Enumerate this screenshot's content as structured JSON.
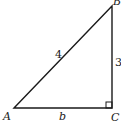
{
  "diagram": {
    "type": "right-triangle",
    "vertices": {
      "A": {
        "label": "A",
        "x": 14,
        "y": 108
      },
      "B": {
        "label": "B",
        "x": 112,
        "y": 6
      },
      "C": {
        "label": "C",
        "x": 112,
        "y": 108
      }
    },
    "sides": {
      "hypotenuse_AB": {
        "label": "4"
      },
      "leg_BC": {
        "label": "3"
      },
      "leg_AC": {
        "label": "b"
      }
    },
    "right_angle_at": "C",
    "stroke_color": "#1a1a1a",
    "background": "#ffffff"
  }
}
